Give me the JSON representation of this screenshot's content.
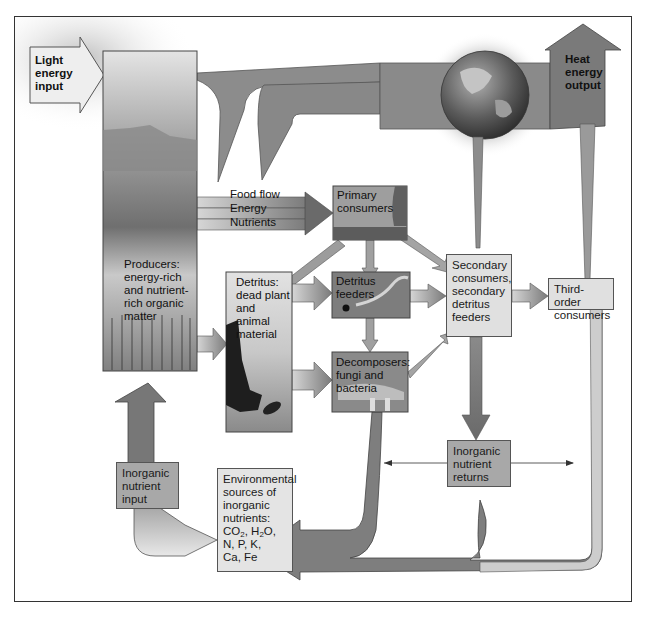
{
  "diagram": {
    "inputs": {
      "light": "Light energy input",
      "heat": "Heat energy output"
    },
    "legend": {
      "food_flow": "Food flow",
      "energy": "Energy",
      "nutrients": "Nutrients"
    },
    "nodes": {
      "producers": "Producers: energy-rich and nutrient-rich organic matter",
      "primary_consumers": "Primary consumers",
      "detritus": "Detritus: dead plant and animal material",
      "detritus_feeders": "Detritus feeders",
      "decomposers": "Decomposers: fungi and bacteria",
      "secondary_consumers": "Secondary consumers, secondary detritus feeders",
      "third_order": "Third-order consumers",
      "inorganic_returns": "Inorganic nutrient returns",
      "inorganic_input": "Inorganic nutrient input",
      "environmental_sources": "Environmental sources of inorganic nutrients:",
      "environmental_list_line1_a": "CO",
      "environmental_list_line1_b": "2",
      "environmental_list_line1_c": ", H",
      "environmental_list_line1_d": "2",
      "environmental_list_line1_e": "O,",
      "environmental_list_line2": "N, P, K,",
      "environmental_list_line3": "Ca, Fe"
    },
    "edges": [
      {
        "from": "light",
        "to": "producers"
      },
      {
        "from": "producers",
        "to": "primary_consumers",
        "label": "Food flow / Energy / Nutrients"
      },
      {
        "from": "producers",
        "to": "detritus"
      },
      {
        "from": "producers",
        "to": "heat"
      },
      {
        "from": "primary_consumers",
        "to": "detritus"
      },
      {
        "from": "primary_consumers",
        "to": "detritus_feeders"
      },
      {
        "from": "primary_consumers",
        "to": "secondary_consumers"
      },
      {
        "from": "detritus",
        "to": "detritus_feeders"
      },
      {
        "from": "detritus",
        "to": "decomposers"
      },
      {
        "from": "detritus_feeders",
        "to": "decomposers"
      },
      {
        "from": "detritus_feeders",
        "to": "secondary_consumers"
      },
      {
        "from": "decomposers",
        "to": "secondary_consumers"
      },
      {
        "from": "secondary_consumers",
        "to": "third_order"
      },
      {
        "from": "secondary_consumers",
        "to": "inorganic_returns"
      },
      {
        "from": "decomposers",
        "to": "environmental_sources"
      },
      {
        "from": "inorganic_returns",
        "to": "environmental_sources"
      },
      {
        "from": "third_order",
        "to": "environmental_sources"
      },
      {
        "from": "environmental_sources",
        "to": "inorganic_input"
      },
      {
        "from": "inorganic_input",
        "to": "producers"
      },
      {
        "from": "secondary_consumers",
        "to": "heat"
      },
      {
        "from": "third_order",
        "to": "heat"
      }
    ],
    "colors": {
      "arrow_dark": "#6e6e6e",
      "arrow_mid": "#9a9a9a",
      "arrow_light": "#cfcfcf",
      "box_fill": "#d9d9d9",
      "box_dark_fill": "#8c8c8c",
      "border": "#333333"
    }
  }
}
